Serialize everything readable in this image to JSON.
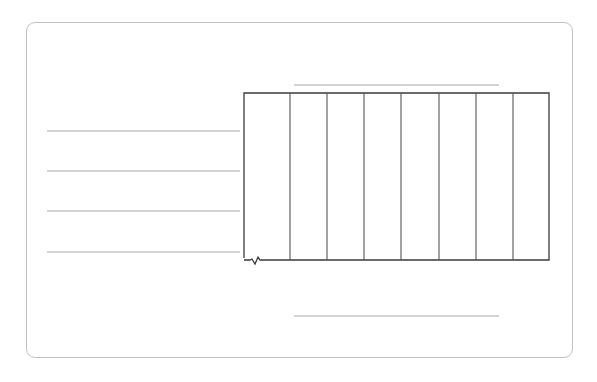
{
  "diagram": {
    "colors": {
      "card_border": "#c2c2c2",
      "guide_line": "#a8a8a8",
      "grid_border": "#3a3a3a",
      "grid_divider": "#555555"
    },
    "left_lines": [
      {
        "x1": 47,
        "x2": 240,
        "y": 131
      },
      {
        "x1": 47,
        "x2": 240,
        "y": 171
      },
      {
        "x1": 47,
        "x2": 240,
        "y": 211
      },
      {
        "x1": 47,
        "x2": 240,
        "y": 252
      }
    ],
    "top_line": {
      "x1": 294,
      "x2": 499,
      "y": 85
    },
    "bottom_line": {
      "x1": 294,
      "x2": 499,
      "y": 316
    },
    "grid": {
      "x": 244,
      "y": 93,
      "width": 305,
      "height": 167,
      "dividers_x": [
        290,
        327,
        364,
        401,
        439,
        476,
        513
      ]
    }
  }
}
